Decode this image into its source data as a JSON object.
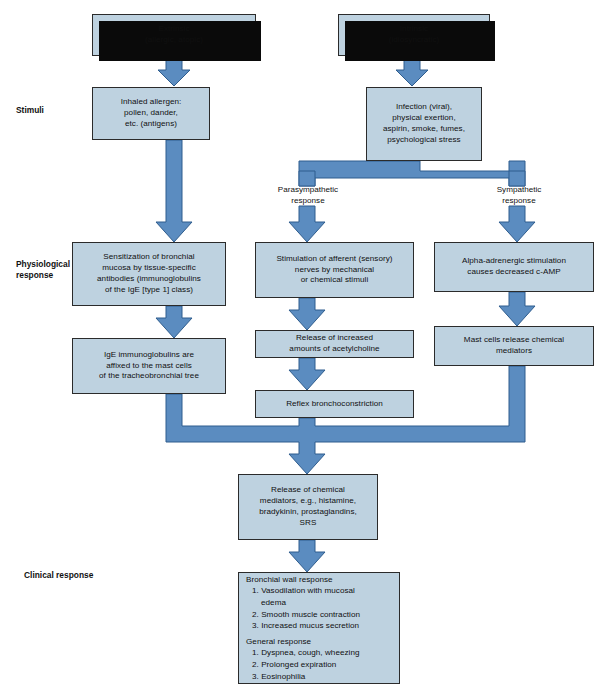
{
  "figure": {
    "colors": {
      "box_fill": "#bed2e0",
      "box_border": "#2b2b2b",
      "connector": "#5b8cc0",
      "connector_edge": "#2f5d8e",
      "shadow": "#0a0a0a",
      "background": "#ffffff",
      "text": "#101010"
    }
  },
  "side_labels": [
    {
      "id": "stimuli",
      "text": "Stimuli"
    },
    {
      "id": "physiological-response",
      "text": "Physiological\nresponse"
    },
    {
      "id": "clinical-response",
      "text": "Clinical response"
    }
  ],
  "branch_labels": [
    {
      "id": "parasympathetic",
      "text": "Parasympathetic\nresponse"
    },
    {
      "id": "sympathetic",
      "text": "Sympathetic\nresponse"
    }
  ],
  "nodes": [
    {
      "id": "extrinsic",
      "text": "Extrinsic\n(allergic, atopic)"
    },
    {
      "id": "intrinsic",
      "text": "Intrinsic\n(idiosyncratic)"
    },
    {
      "id": "inhaled-allergen",
      "text": "Inhaled allergen:\npollen, dander,\netc. (antigens)"
    },
    {
      "id": "infection",
      "text": "Infection (viral),\nphysical exertion,\naspirin, smoke, fumes,\npsychological stress"
    },
    {
      "id": "sensitization",
      "text": "Sensitization of bronchial\nmucosa by tissue-specific\nantibodies (immunoglobulins\nof the IgE [type 1] class)"
    },
    {
      "id": "ige-affixed",
      "text": "IgE immunoglobulins are\naffixed to the mast cells\nof the tracheobronchial tree"
    },
    {
      "id": "afferent-stimulation",
      "text": "Stimulation of afferent (sensory)\nnerves by mechanical\nor chemical stimuli"
    },
    {
      "id": "acetylcholine",
      "text": "Release of increased\namounts of acetylcholine"
    },
    {
      "id": "reflex-bronchoconstriction",
      "text": "Reflex bronchoconstriction"
    },
    {
      "id": "alpha-adrenergic",
      "text": "Alpha-adrenergic stimulation\ncauses decreased c-AMP"
    },
    {
      "id": "mast-cells",
      "text": "Mast cells release chemical\nmediators"
    },
    {
      "id": "chemical-mediators",
      "text": "Release of chemical\nmediators, e.g., histamine,\nbradykinin, prostaglandins,\nSRS"
    }
  ],
  "outcome": {
    "id": "clinical-outcomes",
    "groups": [
      {
        "heading": "Bronchial wall response",
        "items": [
          "1. Vasodilation with mucosal\n    edema",
          "2. Smooth muscle contraction",
          "3. Increased mucus secretion"
        ]
      },
      {
        "heading": "General response",
        "items": [
          "1. Dyspnea, cough, wheezing",
          "2. Prolonged expiration",
          "3. Eosinophilia"
        ]
      }
    ]
  }
}
